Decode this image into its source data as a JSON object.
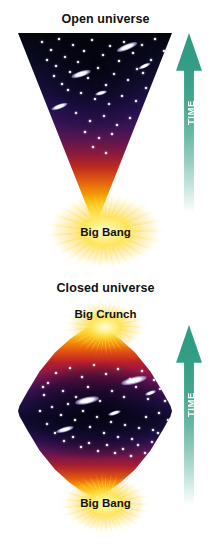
{
  "figure": {
    "background_color": "#ffffff",
    "accent_time_arrow_color": "#2e9b82",
    "burst_color": "#ffe23c"
  },
  "panels": [
    {
      "id": "open-universe",
      "title": "Open universe",
      "shape": "expanding-funnel",
      "time_arrow_label": "TIME",
      "events": [
        {
          "name": "big-bang",
          "label": "Big Bang",
          "position": "bottom"
        }
      ]
    },
    {
      "id": "closed-universe",
      "title": "Closed universe",
      "shape": "lens-diamond",
      "time_arrow_label": "TIME",
      "events": [
        {
          "name": "big-crunch",
          "label": "Big Crunch",
          "position": "top"
        },
        {
          "name": "big-bang",
          "label": "Big Bang",
          "position": "bottom"
        }
      ]
    }
  ],
  "open_panel": {
    "title": "Open universe",
    "time_label": "TIME",
    "bigbang_label": "Big Bang"
  },
  "closed_panel": {
    "title": "Closed universe",
    "time_label": "TIME",
    "bigcrunch_label": "Big Crunch",
    "bigbang_label": "Big Bang"
  },
  "starfield": {
    "open": {
      "stars": [
        [
          24,
          9,
          2.0
        ],
        [
          33,
          17,
          1.4
        ],
        [
          41,
          6,
          1.6
        ],
        [
          47,
          24,
          2.4
        ],
        [
          38,
          33,
          1.5
        ],
        [
          55,
          12,
          1.9
        ],
        [
          52,
          39,
          1.6
        ],
        [
          60,
          29,
          2.6
        ],
        [
          66,
          18,
          1.5
        ],
        [
          70,
          45,
          1.8
        ],
        [
          74,
          7,
          2.2
        ],
        [
          80,
          35,
          2.9
        ],
        [
          85,
          22,
          1.6
        ],
        [
          88,
          52,
          1.7
        ],
        [
          92,
          13,
          2.0
        ],
        [
          96,
          41,
          2.5
        ],
        [
          101,
          28,
          1.6
        ],
        [
          106,
          9,
          1.8
        ],
        [
          110,
          47,
          2.2
        ],
        [
          115,
          20,
          1.5
        ],
        [
          119,
          36,
          2.0
        ],
        [
          124,
          12,
          2.4
        ],
        [
          128,
          55,
          1.6
        ],
        [
          133,
          27,
          1.9
        ],
        [
          137,
          6,
          1.5
        ],
        [
          141,
          43,
          2.1
        ],
        [
          146,
          18,
          1.7
        ],
        [
          150,
          32,
          1.5
        ],
        [
          29,
          27,
          1.5
        ],
        [
          44,
          51,
          1.7
        ],
        [
          63,
          60,
          2.0
        ],
        [
          77,
          66,
          1.5
        ],
        [
          91,
          71,
          2.3
        ],
        [
          104,
          63,
          1.6
        ],
        [
          118,
          68,
          1.8
        ],
        [
          131,
          74,
          1.5
        ],
        [
          58,
          80,
          1.9
        ],
        [
          72,
          88,
          1.5
        ],
        [
          86,
          83,
          2.1
        ],
        [
          99,
          92,
          1.6
        ],
        [
          112,
          85,
          1.8
        ],
        [
          67,
          99,
          1.5
        ],
        [
          81,
          105,
          1.9
        ],
        [
          94,
          101,
          1.5
        ],
        [
          75,
          114,
          1.6
        ],
        [
          88,
          120,
          1.7
        ],
        [
          36,
          43,
          1.4
        ],
        [
          50,
          57,
          1.4
        ],
        [
          125,
          40,
          1.4
        ],
        [
          140,
          60,
          1.5
        ]
      ],
      "galaxies": [
        [
          109,
          14,
          22,
          6,
          -22
        ],
        [
          63,
          41,
          20,
          5.5,
          -18
        ],
        [
          41,
          73,
          17,
          5,
          -20
        ],
        [
          126,
          33,
          13,
          4,
          -25
        ],
        [
          83,
          60,
          12,
          3.5,
          -16
        ]
      ]
    },
    "closed": {
      "stars": [
        [
          30,
          58,
          2.0
        ],
        [
          38,
          48,
          1.6
        ],
        [
          45,
          66,
          2.6
        ],
        [
          52,
          43,
          1.7
        ],
        [
          58,
          72,
          2.0
        ],
        [
          64,
          52,
          2.8
        ],
        [
          70,
          62,
          1.6
        ],
        [
          76,
          40,
          2.2
        ],
        [
          82,
          76,
          2.5
        ],
        [
          88,
          49,
          1.7
        ],
        [
          94,
          66,
          2.1
        ],
        [
          100,
          44,
          1.8
        ],
        [
          106,
          72,
          2.6
        ],
        [
          112,
          54,
          1.6
        ],
        [
          118,
          62,
          2.2
        ],
        [
          124,
          46,
          1.9
        ],
        [
          130,
          74,
          2.4
        ],
        [
          136,
          55,
          1.7
        ],
        [
          142,
          64,
          2.0
        ],
        [
          26,
          70,
          1.7
        ],
        [
          34,
          82,
          2.2
        ],
        [
          43,
          90,
          1.6
        ],
        [
          50,
          79,
          2.0
        ],
        [
          57,
          95,
          1.8
        ],
        [
          65,
          86,
          2.5
        ],
        [
          72,
          102,
          1.6
        ],
        [
          79,
          92,
          2.1
        ],
        [
          86,
          108,
          1.7
        ],
        [
          93,
          97,
          2.3
        ],
        [
          100,
          112,
          1.6
        ],
        [
          107,
          100,
          2.0
        ],
        [
          114,
          114,
          1.8
        ],
        [
          121,
          103,
          2.4
        ],
        [
          128,
          92,
          1.7
        ],
        [
          135,
          105,
          2.1
        ],
        [
          141,
          88,
          1.6
        ],
        [
          22,
          86,
          1.5
        ],
        [
          29,
          99,
          1.9
        ],
        [
          37,
          108,
          1.6
        ],
        [
          46,
          116,
          2.0
        ],
        [
          55,
          112,
          1.5
        ],
        [
          63,
          122,
          1.8
        ],
        [
          71,
          118,
          1.6
        ],
        [
          80,
          126,
          1.9
        ],
        [
          89,
          120,
          1.5
        ],
        [
          97,
          128,
          1.7
        ],
        [
          105,
          124,
          2.0
        ],
        [
          113,
          131,
          1.5
        ],
        [
          120,
          120,
          1.8
        ],
        [
          127,
          128,
          1.6
        ],
        [
          134,
          117,
          1.9
        ],
        [
          140,
          108,
          1.5
        ],
        [
          25,
          62,
          1.5
        ],
        [
          147,
          76,
          1.6
        ],
        [
          150,
          95,
          1.5
        ]
      ],
      "galaxies": [
        [
          116,
          55,
          26,
          7,
          -14
        ],
        [
          69,
          75,
          24,
          6.5,
          -12
        ],
        [
          47,
          104,
          18,
          5,
          -16
        ],
        [
          96,
          88,
          13,
          4,
          -18
        ],
        [
          132,
          68,
          11,
          3.5,
          -20
        ]
      ]
    }
  }
}
